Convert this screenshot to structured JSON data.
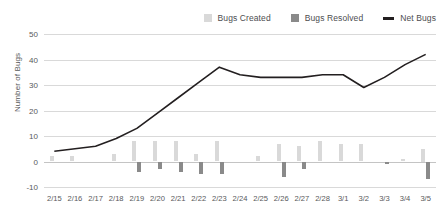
{
  "chart_data": {
    "type": "bar",
    "title": "",
    "xlabel": "",
    "ylabel": "Number of Bugs",
    "ylim": [
      -10,
      50
    ],
    "yticks": [
      50,
      40,
      30,
      20,
      10,
      0,
      -10
    ],
    "grid": true,
    "legend_position": "top-right",
    "categories": [
      "2/15",
      "2/16",
      "2/17",
      "2/18",
      "2/19",
      "2/20",
      "2/21",
      "2/22",
      "2/23",
      "2/24",
      "2/25",
      "2/26",
      "2/27",
      "2/28",
      "3/1",
      "3/2",
      "3/3",
      "3/4",
      "3/5"
    ],
    "series": [
      {
        "name": "Bugs Created",
        "type": "bar",
        "color": "#d9d9d9",
        "values": [
          2,
          2,
          0,
          3,
          8,
          8,
          8,
          3,
          8,
          0,
          2,
          7,
          6,
          8,
          7,
          7,
          0,
          1,
          5
        ]
      },
      {
        "name": "Bugs Resolved",
        "type": "bar",
        "color": "#8a8a8a",
        "values": [
          0,
          0,
          0,
          0,
          -4,
          -3,
          -4,
          -5,
          -5,
          0,
          0,
          -6,
          -3,
          0,
          0,
          0,
          -1,
          0,
          -7
        ]
      },
      {
        "name": "Net Bugs",
        "type": "line",
        "color": "#231f20",
        "values": [
          4,
          5,
          6,
          9,
          13,
          19,
          25,
          31,
          37,
          34,
          33,
          33,
          33,
          34,
          34,
          29,
          33,
          38,
          42
        ]
      }
    ]
  }
}
